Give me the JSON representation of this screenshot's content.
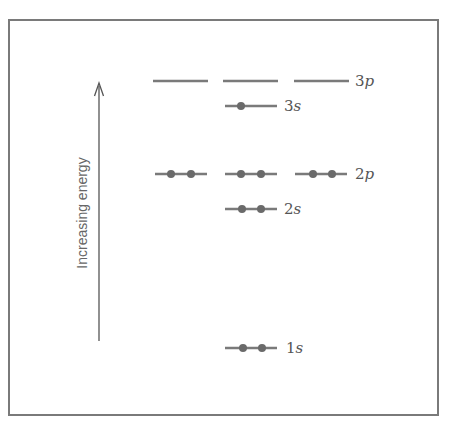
{
  "diagram": {
    "type": "energy-level-diagram",
    "axis": {
      "label": "Increasing energy",
      "direction": "up"
    },
    "colors": {
      "line": "#7a7a7a",
      "electron": "#6a6a6a",
      "label": "#555555",
      "frame": "#7a7a7a"
    },
    "levels": [
      {
        "id": "3p",
        "number": "3",
        "letter": "p",
        "orbitals": 3,
        "electrons_per_orbital": [
          0,
          0,
          0
        ]
      },
      {
        "id": "3s",
        "number": "3",
        "letter": "s",
        "orbitals": 1,
        "electrons_per_orbital": [
          1
        ]
      },
      {
        "id": "2p",
        "number": "2",
        "letter": "p",
        "orbitals": 3,
        "electrons_per_orbital": [
          2,
          2,
          2
        ]
      },
      {
        "id": "2s",
        "number": "2",
        "letter": "s",
        "orbitals": 1,
        "electrons_per_orbital": [
          2
        ]
      },
      {
        "id": "1s",
        "number": "1",
        "letter": "s",
        "orbitals": 1,
        "electrons_per_orbital": [
          2
        ]
      }
    ]
  }
}
